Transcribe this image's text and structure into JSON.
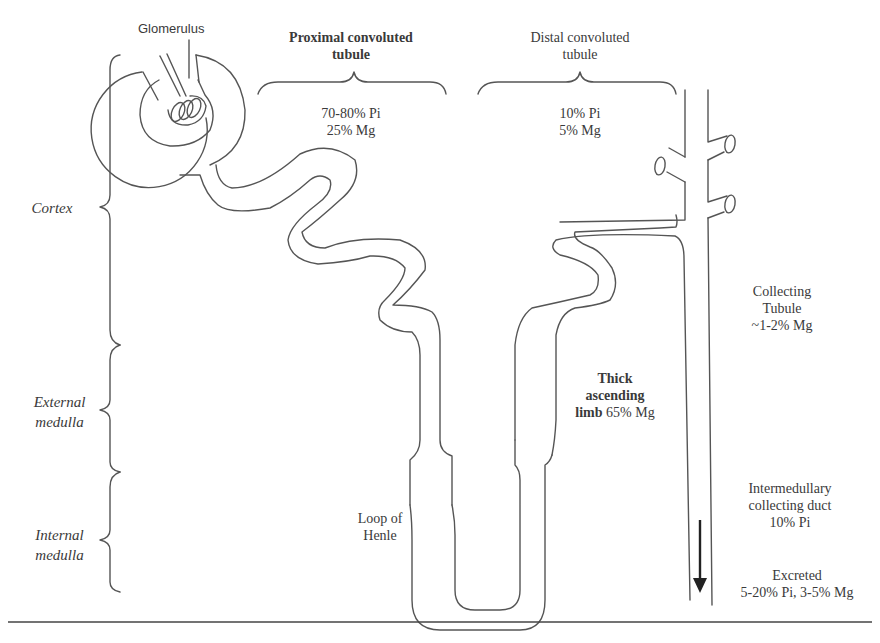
{
  "labels": {
    "glomerulus": "Glomerulus",
    "proximal": {
      "line1": "Proximal convoluted",
      "line2": "tubule",
      "pi": "70-80% Pi",
      "mg": "25% Mg"
    },
    "distal": {
      "line1": "Distal convoluted",
      "line2": "tubule",
      "pi": "10% Pi",
      "mg": "5% Mg"
    },
    "thick_limb": {
      "line1": "Thick",
      "line2": "ascending",
      "line3_bold": "limb",
      "line3_value": "65% Mg"
    },
    "loop": {
      "line1": "Loop of",
      "line2": "Henle"
    },
    "collecting_tubule": {
      "line1": "Collecting",
      "line2": "Tubule",
      "line3": "~1-2% Mg"
    },
    "intermedullary": {
      "line1": "Intermedullary",
      "line2": "collecting duct",
      "line3": "10% Pi"
    },
    "excreted": {
      "line1": "Excreted",
      "line2": "5-20% Pi,  3-5% Mg"
    }
  },
  "regions": [
    {
      "name": "cortex",
      "line1": "Cortex",
      "line2": ""
    },
    {
      "name": "external-medulla",
      "line1": "External",
      "line2": "medulla"
    },
    {
      "name": "internal-medulla",
      "line1": "Internal",
      "line2": "medulla"
    }
  ]
}
